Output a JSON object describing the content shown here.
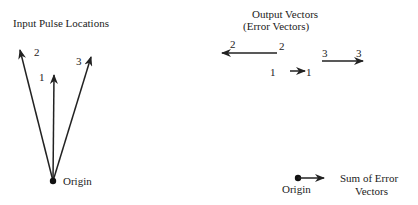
{
  "left_panel": {
    "title": "Input Pulse Locations",
    "origin_label": "Origin",
    "vectors": [
      {
        "id": "1",
        "label": "1"
      },
      {
        "id": "2",
        "label": "2"
      },
      {
        "id": "3",
        "label": "3"
      }
    ]
  },
  "right_panel": {
    "title_line1": "Output Vectors",
    "title_line2": "(Error Vectors)",
    "vectors": [
      {
        "id": "2",
        "start_label": "2",
        "end_label": "2"
      },
      {
        "id": "1",
        "start_label": "1",
        "end_label": "1"
      },
      {
        "id": "3",
        "start_label": "3",
        "end_label": "3"
      }
    ],
    "sum": {
      "origin_label": "Origin",
      "label_line1": "Sum of Error",
      "label_line2": "Vectors"
    }
  },
  "colors": {
    "stroke": "#222222",
    "background": "#ffffff"
  }
}
